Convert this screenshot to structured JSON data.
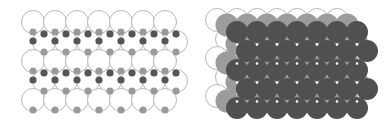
{
  "colors": {
    "background": "#ffffff",
    "outline": "#b8b8b8",
    "large_atom_fill": "#ffffff",
    "small_dark": "#555555",
    "small_light": "#9a9a9a",
    "top_layer": "#505050",
    "mid_layer": "#9c9c9c",
    "gap_highlight": "#ffffff"
  },
  "left_panel": {
    "name": "lattice-with-interstitial-sites",
    "large_radius": 11.5,
    "small_radius": 3.6,
    "rows": [
      {
        "y": 22,
        "x_start": 33,
        "count": 7
      },
      {
        "y": 42,
        "x_start": 44,
        "count": 7
      },
      {
        "y": 61,
        "x_start": 33,
        "count": 7
      },
      {
        "y": 81,
        "x_start": 44,
        "count": 7
      },
      {
        "y": 100,
        "x_start": 33,
        "count": 7
      }
    ],
    "spacing": 22
  },
  "right_panel": {
    "name": "stacked-close-packed-layers",
    "radius": 11.5,
    "spacing": 20,
    "back_layer": {
      "x_start": 217,
      "y_start": 20
    },
    "mid_layer": {
      "x_start": 227,
      "y_start": 25
    },
    "top_layer": {
      "rows": [
        {
          "y": 32,
          "x_start": 237,
          "count": 7
        },
        {
          "y": 51,
          "x_start": 247,
          "count": 7
        },
        {
          "y": 70,
          "x_start": 237,
          "count": 7
        },
        {
          "y": 89,
          "x_start": 247,
          "count": 7
        },
        {
          "y": 108,
          "x_start": 237,
          "count": 7
        }
      ]
    }
  }
}
